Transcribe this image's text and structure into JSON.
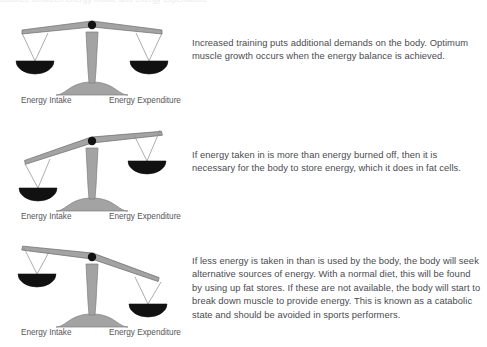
{
  "page": {
    "background_color": "#ffffff",
    "top_cropped_text": "balance between energy intake and energy expenditure"
  },
  "palette": {
    "beam_fill": "#a3a3a3",
    "beam_stroke": "#6f6f6f",
    "column_fill": "#a3a3a3",
    "base_fill": "#a3a3a3",
    "pan_fill": "#111111",
    "string_stroke": "#8a8a8a",
    "pivot_fill": "#111111",
    "text_color": "#4a4b4f",
    "label_color": "#55565a"
  },
  "labels": {
    "intake": "Energy Intake",
    "expenditure": "Energy Expenditure"
  },
  "blocks": [
    {
      "id": "balanced",
      "scale": {
        "state": "balanced",
        "tilt_degrees": 0,
        "left_pan_label": "Energy Intake",
        "right_pan_label": "Energy Expenditure",
        "heavier_side": "none"
      },
      "text": "Increased training puts additional demands on the body. Optimum muscle growth occurs when the energy balance is achieved."
    },
    {
      "id": "intake-heavier",
      "scale": {
        "state": "tilted-left-down",
        "tilt_degrees": -12,
        "left_pan_label": "Energy Intake",
        "right_pan_label": "Energy Expenditure",
        "heavier_side": "left"
      },
      "text": "If energy taken in is more than energy burned off, then it is necessary for the body to store energy, which it does in fat cells."
    },
    {
      "id": "expenditure-heavier",
      "scale": {
        "state": "tilted-right-down",
        "tilt_degrees": 13,
        "left_pan_label": "Energy Intake",
        "right_pan_label": "Energy Expenditure",
        "heavier_side": "right"
      },
      "text": "If less energy is taken in than is used by the body, the body will seek alternative sources of energy. With a normal diet, this will be found by using up fat stores. If these are not available, the body will start to break down muscle to provide energy. This is known as a catabolic state and should be avoided in sports performers."
    }
  ]
}
